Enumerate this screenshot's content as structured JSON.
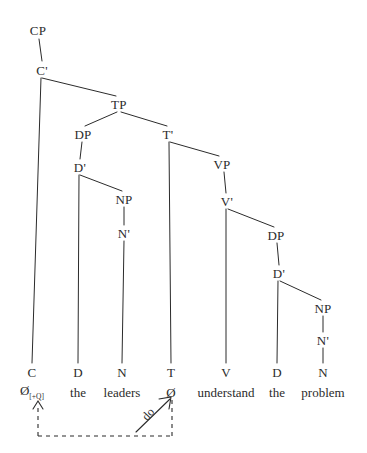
{
  "figure": {
    "kind": "x-bar-syntax-tree",
    "sentence": "Do the leaders understand the problem?",
    "ink_color": "#2b2b2b",
    "background_color": "#ffffff"
  },
  "nodes": {
    "cp": {
      "label": "CP",
      "x": 38,
      "y": 30
    },
    "cbar": {
      "label": "C'",
      "x": 42,
      "y": 70
    },
    "tp": {
      "label": "TP",
      "x": 119,
      "y": 104
    },
    "dp_subj": {
      "label": "DP",
      "x": 83,
      "y": 134
    },
    "tbar": {
      "label": "T'",
      "x": 168,
      "y": 134
    },
    "dbar_subj": {
      "label": "D'",
      "x": 80,
      "y": 167
    },
    "vp": {
      "label": "VP",
      "x": 222,
      "y": 164
    },
    "np_subj": {
      "label": "NP",
      "x": 124,
      "y": 199
    },
    "vbar": {
      "label": "V'",
      "x": 227,
      "y": 201
    },
    "nbar_subj": {
      "label": "N'",
      "x": 124,
      "y": 233
    },
    "dp_obj": {
      "label": "DP",
      "x": 276,
      "y": 235
    },
    "dbar_obj": {
      "label": "D'",
      "x": 279,
      "y": 273
    },
    "np_obj": {
      "label": "NP",
      "x": 323,
      "y": 308
    },
    "nbar_obj": {
      "label": "N'",
      "x": 323,
      "y": 340
    }
  },
  "terminals": [
    {
      "category": "C",
      "word": "Ø",
      "feature": "[+Q]",
      "x": 32,
      "cat_y": 372,
      "word_y": 392
    },
    {
      "category": "D",
      "word": "the",
      "feature": "",
      "x": 78,
      "cat_y": 372,
      "word_y": 392
    },
    {
      "category": "N",
      "word": "leaders",
      "feature": "",
      "x": 122,
      "cat_y": 372,
      "word_y": 392
    },
    {
      "category": "T",
      "word": "Ø",
      "feature": "",
      "x": 171,
      "cat_y": 372,
      "word_y": 392
    },
    {
      "category": "V",
      "word": "understand",
      "feature": "",
      "x": 226,
      "cat_y": 372,
      "word_y": 392
    },
    {
      "category": "D",
      "word": "the",
      "feature": "",
      "x": 277,
      "cat_y": 372,
      "word_y": 392
    },
    {
      "category": "N",
      "word": "problem",
      "feature": "",
      "x": 323,
      "cat_y": 372,
      "word_y": 392
    }
  ],
  "movement": {
    "label": "do",
    "label_x": 148,
    "label_y": 414,
    "label_rotation": -48,
    "description": "T-to-C movement of do"
  },
  "chart_data": {
    "type": "tree",
    "root": "CP",
    "edges": [
      [
        "CP",
        "C'"
      ],
      [
        "C'",
        "C"
      ],
      [
        "C'",
        "TP"
      ],
      [
        "TP",
        "DP-subject"
      ],
      [
        "TP",
        "T'"
      ],
      [
        "DP-subject",
        "D'-subject"
      ],
      [
        "D'-subject",
        "D-the"
      ],
      [
        "D'-subject",
        "NP-subject"
      ],
      [
        "NP-subject",
        "N'-subject"
      ],
      [
        "N'-subject",
        "N-leaders"
      ],
      [
        "T'",
        "T"
      ],
      [
        "T'",
        "VP"
      ],
      [
        "VP",
        "V'"
      ],
      [
        "V'",
        "V-understand"
      ],
      [
        "V'",
        "DP-object"
      ],
      [
        "DP-object",
        "D'-object"
      ],
      [
        "D'-object",
        "D-the"
      ],
      [
        "D'-object",
        "NP-object"
      ],
      [
        "NP-object",
        "N'-object"
      ],
      [
        "N'-object",
        "N-problem"
      ]
    ],
    "leaves": [
      "Ø[+Q]",
      "the",
      "leaders",
      "Ø",
      "understand",
      "the",
      "problem"
    ],
    "movement_arrows": [
      {
        "from": "T",
        "to": "C",
        "label": "do",
        "style": "dashed"
      }
    ]
  }
}
